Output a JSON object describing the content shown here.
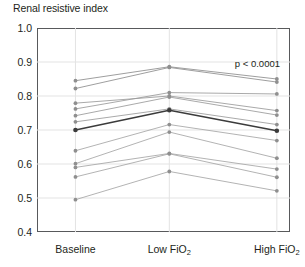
{
  "chart_data": {
    "type": "line",
    "title": "Renal resistive index",
    "xlabel": "",
    "ylabel": "",
    "ylim": [
      0.4,
      1.0
    ],
    "yticks": [
      "1.0",
      "0.9",
      "0.8",
      "0.7",
      "0.6",
      "0.5",
      "0.4"
    ],
    "ytick_values": [
      1.0,
      0.9,
      0.8,
      0.7,
      0.6,
      0.5,
      0.4
    ],
    "categories": [
      "Baseline",
      "Low FiO2",
      "High FiO2"
    ],
    "category_labels_html": [
      "Baseline",
      "Low FiO<sub>2</sub>",
      "High FiO<sub>2</sub>"
    ],
    "grid": true,
    "legend": "none",
    "annotations": [
      {
        "text": "p < 0.0001",
        "position": "top-right"
      }
    ],
    "series": [
      {
        "name": "subject-1",
        "values": [
          0.845,
          0.886,
          0.85
        ],
        "color": "#8c8c8c",
        "emphasis": false
      },
      {
        "name": "subject-2",
        "values": [
          0.822,
          0.884,
          0.841
        ],
        "color": "#8c8c8c",
        "emphasis": false
      },
      {
        "name": "subject-3",
        "values": [
          0.779,
          0.8,
          0.757
        ],
        "color": "#9a9a9a",
        "emphasis": false
      },
      {
        "name": "subject-4",
        "values": [
          0.762,
          0.81,
          0.806
        ],
        "color": "#9a9a9a",
        "emphasis": false
      },
      {
        "name": "subject-5",
        "values": [
          0.742,
          0.797,
          0.744
        ],
        "color": "#9a9a9a",
        "emphasis": false
      },
      {
        "name": "subject-6",
        "values": [
          0.724,
          0.762,
          0.716
        ],
        "color": "#9a9a9a",
        "emphasis": false
      },
      {
        "name": "subject-7",
        "values": [
          0.7,
          0.758,
          0.698
        ],
        "color": "#3b3b3b",
        "emphasis": true
      },
      {
        "name": "subject-8",
        "values": [
          0.639,
          0.716,
          0.669
        ],
        "color": "#a5a5a5",
        "emphasis": false
      },
      {
        "name": "subject-9",
        "values": [
          0.601,
          0.694,
          0.617
        ],
        "color": "#a5a5a5",
        "emphasis": false
      },
      {
        "name": "subject-10",
        "values": [
          0.59,
          0.631,
          0.585
        ],
        "color": "#a5a5a5",
        "emphasis": false
      },
      {
        "name": "subject-11",
        "values": [
          0.562,
          0.63,
          0.561
        ],
        "color": "#a5a5a5",
        "emphasis": false
      },
      {
        "name": "subject-12",
        "values": [
          0.495,
          0.578,
          0.521
        ],
        "color": "#a5a5a5",
        "emphasis": false
      }
    ]
  },
  "figure": {
    "title": "Renal resistive index",
    "pvalue": "p < 0.0001"
  },
  "colors": {
    "frame": "#58595b",
    "grid": "#e3e3e3",
    "text": "#231f20",
    "line_default": "#9a9a9a",
    "line_emphasis": "#3b3b3b",
    "background": "#ffffff"
  }
}
